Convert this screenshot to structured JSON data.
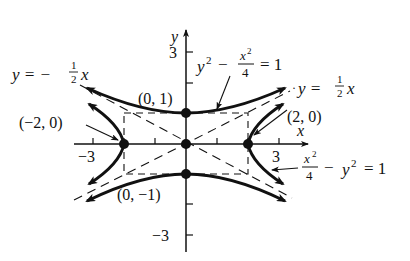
{
  "axes": {
    "x_label": "x",
    "y_label": "y",
    "x_ticks": [
      {
        "value": -3,
        "label": "−3"
      },
      {
        "value": 3,
        "label": "3"
      }
    ],
    "y_ticks": [
      {
        "value": 3,
        "label": "3"
      },
      {
        "value": -3,
        "label": "−3"
      }
    ]
  },
  "curves": {
    "vertical_hyperbola": {
      "lhs_y": "y",
      "lhs_y_exp": "2",
      "minus": "−",
      "frac_num": "x",
      "frac_num_exp": "2",
      "frac_den": "4",
      "rhs": "= 1"
    },
    "horizontal_hyperbola": {
      "frac_num": "x",
      "frac_num_exp": "2",
      "frac_den": "4",
      "minus": "−",
      "y": "y",
      "y_exp": "2",
      "rhs": "= 1"
    }
  },
  "asymptotes": {
    "negative": {
      "lhs": "y = −",
      "num": "1",
      "den": "2",
      "var": "x"
    },
    "positive": {
      "lhs": "y =",
      "num": "1",
      "den": "2",
      "var": "x"
    }
  },
  "points": [
    {
      "label": "(0, 1)"
    },
    {
      "label": "(0, −1)"
    },
    {
      "label": "(−2, 0)"
    },
    {
      "label": "(2, 0)"
    }
  ],
  "colors": {
    "ink": "#111111",
    "background": "#ffffff"
  }
}
